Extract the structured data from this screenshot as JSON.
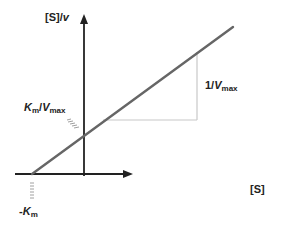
{
  "diagram": {
    "type": "Lineweaver-Burk style (Hanes-Woolf) linear plot",
    "axes": {
      "y_label": {
        "main": "[S]/",
        "italic": "v"
      },
      "x_label": "[S]"
    },
    "annotations": {
      "y_intercept": {
        "k": "K",
        "k_sub": "m",
        "sep": "/",
        "v": "V",
        "v_sub": "max"
      },
      "slope": {
        "prefix": "1/",
        "v": "V",
        "v_sub": "max"
      },
      "x_intercept": {
        "prefix": "-",
        "k": "K",
        "k_sub": "m"
      }
    },
    "colors": {
      "axis": "#222222",
      "line": "#666666",
      "triangle": "#c8c8c8",
      "tick": "#888888",
      "text": "#222222"
    }
  }
}
